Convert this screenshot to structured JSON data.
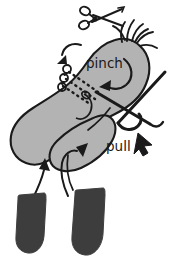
{
  "figure": {
    "background_color": "#ffffff",
    "width": 176,
    "height": 259
  },
  "labels": {
    "pinch": "pinch",
    "pull": "pull"
  },
  "colors": {
    "outline": "#1a1a1a",
    "mitten_fill": "#b3b3b3",
    "finger_fill": "#3d3d3d",
    "background": "#ffffff",
    "thread": "#1a1a1a"
  },
  "elements": {
    "scissors": "scissors-icon",
    "frayed_yarn": "frayed-yarn-ends",
    "mitten_body": "mitten-body",
    "stitch_line": "dashed-stitch-line",
    "yarn_loops": "yarn-loops",
    "needle": "sewing-needle",
    "thread_tail": "thread-tail",
    "arrow_cut": "cut-arrow",
    "arrow_pinch": "pinch-arrow",
    "arrow_pull": "pull-arrow",
    "arrow_insert_left": "insert-arrow-left",
    "arrow_insert_right": "insert-arrow-right",
    "finger_left": "finger-shape-left",
    "finger_right": "finger-shape-right"
  }
}
